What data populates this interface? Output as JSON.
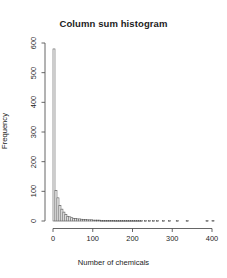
{
  "chart_data": {
    "type": "bar",
    "title": "Column sum histogram",
    "xlabel": "Number of chemicals",
    "ylabel": "Frequency",
    "xlim": [
      0,
      410
    ],
    "ylim": [
      0,
      600
    ],
    "xticks": [
      0,
      100,
      200,
      300,
      400
    ],
    "yticks": [
      0,
      100,
      200,
      300,
      400,
      500,
      600
    ],
    "grid": false,
    "legend": null,
    "bin_width": 5,
    "bin_starts": [
      0,
      5,
      10,
      15,
      20,
      25,
      30,
      35,
      40,
      45,
      50,
      55,
      60,
      65,
      70,
      75,
      80,
      85,
      90,
      95,
      100,
      105,
      110,
      115,
      120,
      125,
      130,
      135,
      140,
      145,
      150,
      155,
      160,
      165,
      170,
      175,
      180,
      185,
      190,
      195,
      200,
      205,
      210,
      215,
      220,
      225,
      230,
      235,
      240,
      245,
      250,
      255,
      260,
      265,
      270,
      275,
      280,
      285,
      290,
      295,
      300,
      305,
      310,
      315,
      320,
      325,
      330,
      335,
      340,
      345,
      350,
      355,
      360,
      365,
      370,
      375,
      380,
      385,
      390,
      395,
      400
    ],
    "values": [
      580,
      103,
      78,
      52,
      40,
      30,
      22,
      16,
      14,
      11,
      9,
      8,
      7,
      7,
      6,
      5,
      5,
      4,
      4,
      4,
      3,
      3,
      3,
      3,
      2,
      2,
      2,
      2,
      2,
      2,
      2,
      1,
      1,
      1,
      1,
      1,
      1,
      1,
      1,
      1,
      1,
      1,
      1,
      1,
      1,
      0,
      1,
      0,
      1,
      0,
      1,
      0,
      1,
      0,
      0,
      1,
      0,
      0,
      1,
      0,
      0,
      0,
      1,
      0,
      0,
      0,
      0,
      1,
      0,
      0,
      0,
      0,
      0,
      0,
      0,
      0,
      0,
      1,
      0,
      0,
      2
    ]
  },
  "labels": {
    "title": "Column sum histogram",
    "xlabel": "Number of chemicals",
    "ylabel": "Frequency"
  }
}
